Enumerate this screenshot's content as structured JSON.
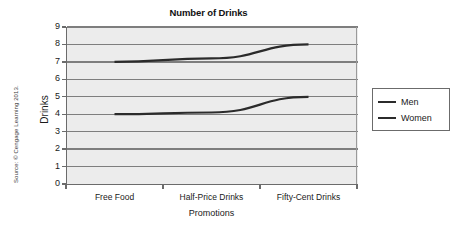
{
  "chart_data": {
    "type": "line",
    "title": "Number of Drinks",
    "xlabel": "Promotions",
    "ylabel": "Drinks",
    "categories": [
      "Free Food",
      "Half-Price Drinks",
      "Fifty-Cent Drinks"
    ],
    "series": [
      {
        "name": "Men",
        "values": [
          7,
          7.2,
          8
        ],
        "color": "#2b2b2b"
      },
      {
        "name": "Women",
        "values": [
          4,
          4.1,
          5
        ],
        "color": "#2b2b2b"
      }
    ],
    "ylim": [
      0,
      9
    ],
    "yticks": [
      0,
      1,
      2,
      3,
      4,
      5,
      6,
      7,
      8,
      9
    ],
    "grid": "horizontal",
    "legend_position": "right",
    "legend_entries": [
      "Men",
      "Women"
    ]
  },
  "credit": {
    "source_text": "Source: © Cengage Learning 2013."
  },
  "colors": {
    "plot_background": "#ececec",
    "gridline": "#7e7e7e",
    "axis": "#6b6b6b",
    "line": "#2b2b2b",
    "text": "#1a1a1a"
  }
}
